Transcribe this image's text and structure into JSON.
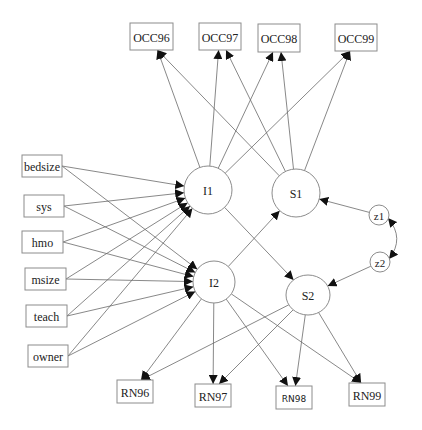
{
  "diagram": {
    "title": "",
    "observed_top": [
      {
        "id": "OCC96",
        "label": "OCC96",
        "x": 130,
        "y": 23,
        "w": 43,
        "h": 27
      },
      {
        "id": "OCC97",
        "label": "OCC97",
        "x": 199,
        "y": 23,
        "w": 42,
        "h": 27
      },
      {
        "id": "OCC98",
        "label": "OCC98",
        "x": 258,
        "y": 24,
        "w": 42,
        "h": 28
      },
      {
        "id": "OCC99",
        "label": "OCC99",
        "x": 335,
        "y": 24,
        "w": 42,
        "h": 27
      }
    ],
    "covariates": [
      {
        "id": "bedsize",
        "label": "bedsize",
        "x": 22,
        "y": 155,
        "w": 40,
        "h": 22
      },
      {
        "id": "sys",
        "label": "sys",
        "x": 24,
        "y": 195,
        "w": 40,
        "h": 22
      },
      {
        "id": "hmo",
        "label": "hmo",
        "x": 22,
        "y": 231,
        "w": 41,
        "h": 22
      },
      {
        "id": "msize",
        "label": "msize",
        "x": 25,
        "y": 268,
        "w": 41,
        "h": 22
      },
      {
        "id": "teach",
        "label": "teach",
        "x": 26,
        "y": 305,
        "w": 41,
        "h": 22
      },
      {
        "id": "owner",
        "label": "owner",
        "x": 28,
        "y": 345,
        "w": 40,
        "h": 22
      }
    ],
    "observed_bottom": [
      {
        "id": "RN96",
        "label": "RN96",
        "x": 117,
        "y": 380,
        "w": 36,
        "h": 23
      },
      {
        "id": "RN97",
        "label": "RN97",
        "x": 195,
        "y": 384,
        "w": 36,
        "h": 23
      },
      {
        "id": "RN98",
        "label": "RN98",
        "x": 276,
        "y": 386,
        "w": 36,
        "h": 23
      },
      {
        "id": "RN99",
        "label": "RN99",
        "x": 349,
        "y": 383,
        "w": 36,
        "h": 23
      }
    ],
    "latent": [
      {
        "id": "I1",
        "label": "I1",
        "cx": 208,
        "cy": 190,
        "rx": 24,
        "ry": 24
      },
      {
        "id": "S1",
        "label": "S1",
        "cx": 296,
        "cy": 193,
        "rx": 24,
        "ry": 24
      },
      {
        "id": "I2",
        "label": "I2",
        "cx": 214,
        "cy": 282,
        "rx": 21,
        "ry": 21
      },
      {
        "id": "S2",
        "label": "S2",
        "cx": 308,
        "cy": 295,
        "rx": 22,
        "ry": 20
      }
    ],
    "disturbances": [
      {
        "id": "z1",
        "label": "z1",
        "cx": 379,
        "cy": 215,
        "rx": 10,
        "ry": 10
      },
      {
        "id": "z2",
        "label": "z2",
        "cx": 380,
        "cy": 262,
        "rx": 10,
        "ry": 10
      }
    ],
    "edges": [
      {
        "from": "I1",
        "to": "OCC96"
      },
      {
        "from": "I1",
        "to": "OCC97"
      },
      {
        "from": "I1",
        "to": "OCC98"
      },
      {
        "from": "I1",
        "to": "OCC99"
      },
      {
        "from": "S1",
        "to": "OCC96"
      },
      {
        "from": "S1",
        "to": "OCC97"
      },
      {
        "from": "S1",
        "to": "OCC98"
      },
      {
        "from": "S1",
        "to": "OCC99"
      },
      {
        "from": "bedsize",
        "to": "I1"
      },
      {
        "from": "sys",
        "to": "I1"
      },
      {
        "from": "hmo",
        "to": "I1"
      },
      {
        "from": "msize",
        "to": "I1"
      },
      {
        "from": "teach",
        "to": "I1"
      },
      {
        "from": "owner",
        "to": "I1"
      },
      {
        "from": "bedsize",
        "to": "I2"
      },
      {
        "from": "sys",
        "to": "I2"
      },
      {
        "from": "hmo",
        "to": "I2"
      },
      {
        "from": "msize",
        "to": "I2"
      },
      {
        "from": "teach",
        "to": "I2"
      },
      {
        "from": "owner",
        "to": "I2"
      },
      {
        "from": "I1",
        "to": "S2"
      },
      {
        "from": "I2",
        "to": "S1"
      },
      {
        "from": "z1",
        "to": "S1"
      },
      {
        "from": "z2",
        "to": "S2"
      },
      {
        "from": "I2",
        "to": "RN96"
      },
      {
        "from": "I2",
        "to": "RN97"
      },
      {
        "from": "I2",
        "to": "RN98"
      },
      {
        "from": "I2",
        "to": "RN99"
      },
      {
        "from": "S2",
        "to": "RN96"
      },
      {
        "from": "S2",
        "to": "RN97"
      },
      {
        "from": "S2",
        "to": "RN98"
      },
      {
        "from": "S2",
        "to": "RN99"
      }
    ],
    "covariances": [
      {
        "between": [
          "z1",
          "z2"
        ],
        "style": "curved-double-headed"
      }
    ],
    "colors": {
      "node_stroke": "#8c8c8c",
      "edge": "#6a6a6a",
      "arrowhead": "#111111",
      "text": "#222222",
      "background": "#ffffff"
    }
  }
}
